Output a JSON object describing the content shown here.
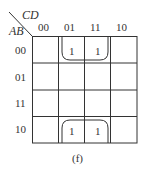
{
  "kmap": {
    "row_var": "AB",
    "col_var": "CD",
    "col_labels": [
      "00",
      "01",
      "11",
      "10"
    ],
    "row_labels": [
      "00",
      "01",
      "11",
      "10"
    ],
    "cells": [
      [
        "",
        "1",
        "1",
        ""
      ],
      [
        "",
        "",
        "",
        ""
      ],
      [
        "",
        "",
        "",
        ""
      ],
      [
        "",
        "1",
        "1",
        ""
      ]
    ],
    "groups": [
      {
        "name": "top-group",
        "rows": [
          0
        ],
        "cols": [
          1,
          2
        ],
        "wraps": "top-bottom"
      },
      {
        "name": "bottom-group",
        "rows": [
          3
        ],
        "cols": [
          1,
          2
        ],
        "wraps": "top-bottom"
      }
    ],
    "line_color": "#333333"
  },
  "caption": "(f)"
}
